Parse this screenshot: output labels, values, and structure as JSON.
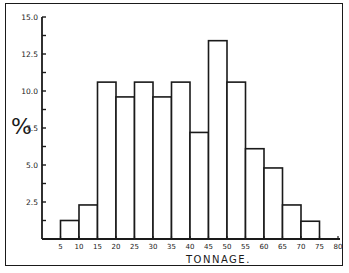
{
  "chart_data": {
    "type": "bar",
    "subtype": "histogram",
    "title": "",
    "xlabel": "TONNAGE.",
    "ylabel": "%",
    "x_ticks": [
      5,
      10,
      15,
      20,
      25,
      30,
      35,
      40,
      45,
      50,
      55,
      60,
      65,
      70,
      75,
      80
    ],
    "x_tick_labels": [
      "5",
      "10",
      "15",
      "20",
      "25",
      "30",
      "35",
      "40",
      "45",
      "50",
      "55",
      "60",
      "65",
      "70",
      "75",
      "80"
    ],
    "y_ticks": [
      2.5,
      5.0,
      7.5,
      10.0,
      12.5,
      15.0
    ],
    "y_tick_labels": [
      "2.5",
      "5.0",
      "7.5",
      "10.0",
      "12.5",
      "15.0"
    ],
    "xlim": [
      0,
      80
    ],
    "ylim": [
      0,
      15
    ],
    "grid": false,
    "legend": null,
    "bins": [
      {
        "range": "5-10",
        "x0": 5,
        "x1": 10,
        "value": 1.25
      },
      {
        "range": "10-15",
        "x0": 10,
        "x1": 15,
        "value": 2.3
      },
      {
        "range": "15-20",
        "x0": 15,
        "x1": 20,
        "value": 10.6
      },
      {
        "range": "20-25",
        "x0": 20,
        "x1": 25,
        "value": 9.6
      },
      {
        "range": "25-30",
        "x0": 25,
        "x1": 30,
        "value": 10.6
      },
      {
        "range": "30-35",
        "x0": 30,
        "x1": 35,
        "value": 9.6
      },
      {
        "range": "35-40",
        "x0": 35,
        "x1": 40,
        "value": 10.6
      },
      {
        "range": "40-45",
        "x0": 40,
        "x1": 45,
        "value": 7.2
      },
      {
        "range": "45-50",
        "x0": 45,
        "x1": 50,
        "value": 13.4
      },
      {
        "range": "50-55",
        "x0": 50,
        "x1": 55,
        "value": 10.6
      },
      {
        "range": "55-60",
        "x0": 55,
        "x1": 60,
        "value": 6.1
      },
      {
        "range": "60-65",
        "x0": 60,
        "x1": 65,
        "value": 4.8
      },
      {
        "range": "65-70",
        "x0": 65,
        "x1": 70,
        "value": 2.3
      },
      {
        "range": "70-75",
        "x0": 70,
        "x1": 75,
        "value": 1.2
      }
    ],
    "categories": [
      "5-10",
      "10-15",
      "15-20",
      "20-25",
      "25-30",
      "30-35",
      "35-40",
      "40-45",
      "45-50",
      "50-55",
      "55-60",
      "60-65",
      "65-70",
      "70-75"
    ],
    "values": [
      1.25,
      2.3,
      10.6,
      9.6,
      10.6,
      9.6,
      10.6,
      7.2,
      13.4,
      10.6,
      6.1,
      4.8,
      2.3,
      1.2
    ]
  },
  "style": {
    "ink": "#1a1a1a",
    "background": "#ffffff"
  }
}
